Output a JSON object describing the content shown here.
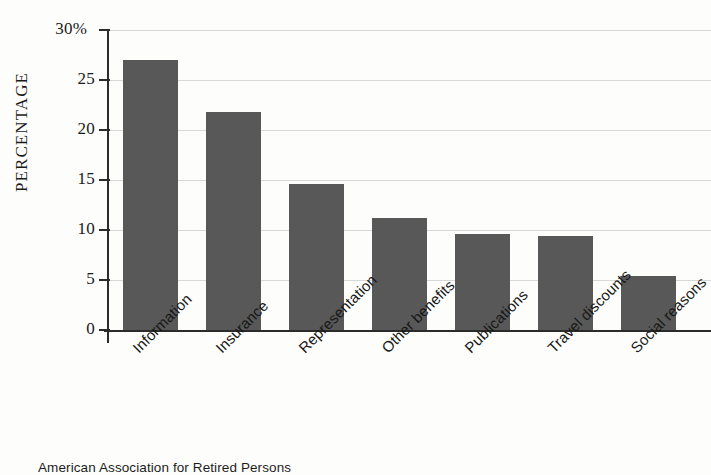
{
  "chart_data": {
    "type": "bar",
    "title": "",
    "subtitle": "",
    "xlabel": "",
    "ylabel": "PERCENTAGE",
    "ylim": [
      0,
      30
    ],
    "ytick_values": [
      0,
      5,
      10,
      15,
      20,
      25,
      30
    ],
    "ytick_labels": [
      "0",
      "5",
      "10",
      "15",
      "20",
      "25",
      "30%"
    ],
    "grid": "horizontal",
    "legend": "none",
    "bar_color": "#585858",
    "gridline_color": "#d7d7d7",
    "axis_color": "#2b2b2b",
    "label_rotation": -45,
    "categories": [
      "Information",
      "Insurance",
      "Representation",
      "Other benefits",
      "Publications",
      "Travel discounts",
      "Social reasons"
    ],
    "values": [
      27.0,
      21.8,
      14.6,
      11.2,
      9.6,
      9.4,
      5.4
    ]
  },
  "caption": {
    "source_note": "American Association for Retired Persons"
  }
}
